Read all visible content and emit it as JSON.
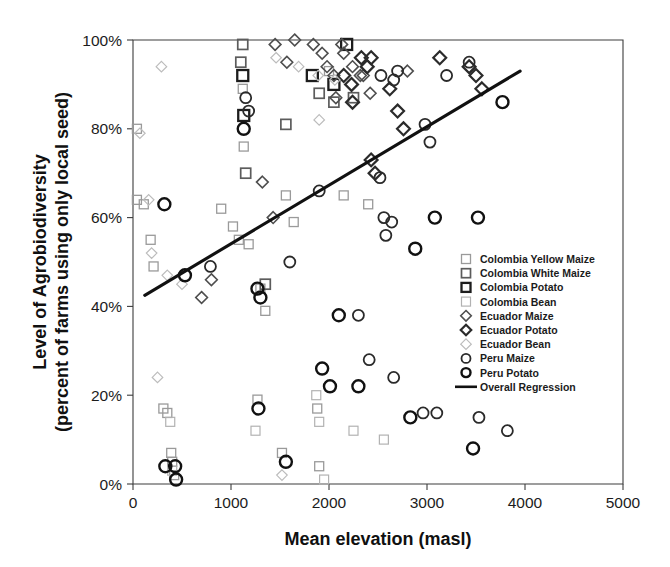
{
  "chart_data": {
    "type": "scatter",
    "title": "",
    "xlabel": "Mean elevation (masl)",
    "ylabel": "Level of Agrobiodiversity (percent of farms using only local seed)",
    "ylabel_line1": "Level of Agrobiodiversity",
    "ylabel_line2": "(percent of farms using only local seed)",
    "xlim": [
      0,
      5000
    ],
    "ylim": [
      0,
      100
    ],
    "xticks": [
      0,
      1000,
      2000,
      3000,
      4000,
      5000
    ],
    "xtick_labels": [
      "0",
      "1000",
      "2000",
      "3000",
      "4000",
      "5000"
    ],
    "yticks": [
      0,
      20,
      40,
      60,
      80,
      100
    ],
    "ytick_labels": [
      "0%",
      "20%",
      "40%",
      "60%",
      "80%",
      "100%"
    ],
    "grid": false,
    "legend_position": "inside-right",
    "series": [
      {
        "name": "Colombia Yellow Maize",
        "marker": "square",
        "color": "#9a9a9a",
        "stroke_width": 1.3,
        "size": 9,
        "points": [
          [
            40,
            80
          ],
          [
            40,
            64
          ],
          [
            110,
            63
          ],
          [
            180,
            55
          ],
          [
            210,
            49
          ],
          [
            310,
            17
          ],
          [
            350,
            16
          ],
          [
            390,
            7
          ],
          [
            400,
            5
          ],
          [
            420,
            2
          ],
          [
            900,
            62
          ],
          [
            1020,
            58
          ],
          [
            1080,
            55
          ],
          [
            1120,
            89
          ],
          [
            1130,
            76
          ],
          [
            1180,
            54
          ],
          [
            1270,
            19
          ],
          [
            1300,
            44
          ],
          [
            1350,
            39
          ],
          [
            1520,
            7
          ],
          [
            1560,
            65
          ],
          [
            1640,
            59
          ],
          [
            1880,
            17
          ],
          [
            1900,
            4
          ],
          [
            2000,
            93
          ],
          [
            2150,
            65
          ],
          [
            2400,
            63
          ]
        ]
      },
      {
        "name": "Colombia White Maize",
        "marker": "square",
        "color": "#5c5c5c",
        "stroke_width": 1.7,
        "size": 10,
        "points": [
          [
            1100,
            95
          ],
          [
            1120,
            99
          ],
          [
            1150,
            70
          ],
          [
            1560,
            81
          ],
          [
            1900,
            88
          ],
          [
            2050,
            86
          ],
          [
            2250,
            87
          ],
          [
            1350,
            45
          ]
        ]
      },
      {
        "name": "Colombia Potato",
        "marker": "square",
        "color": "#1d1d1d",
        "stroke_width": 2.3,
        "size": 11,
        "points": [
          [
            1120,
            92
          ],
          [
            1130,
            83
          ],
          [
            1830,
            92
          ],
          [
            2050,
            90
          ],
          [
            2180,
            99
          ]
        ]
      },
      {
        "name": "Colombia Bean",
        "marker": "square",
        "color": "#b2b2b2",
        "stroke_width": 1.2,
        "size": 9,
        "points": [
          [
            380,
            14
          ],
          [
            400,
            3
          ],
          [
            1250,
            12
          ],
          [
            1870,
            20
          ],
          [
            1900,
            14
          ],
          [
            2250,
            12
          ],
          [
            2560,
            10
          ],
          [
            1950,
            1
          ]
        ]
      },
      {
        "name": "Ecuador Maize",
        "marker": "diamond",
        "color": "#4e4e4e",
        "stroke_width": 1.6,
        "size": 10,
        "points": [
          [
            1650,
            100
          ],
          [
            1840,
            99
          ],
          [
            1930,
            97
          ],
          [
            1980,
            94
          ],
          [
            2130,
            99
          ],
          [
            2150,
            97
          ],
          [
            2240,
            94
          ],
          [
            2320,
            92
          ],
          [
            2350,
            92
          ],
          [
            2420,
            88
          ],
          [
            2800,
            93
          ],
          [
            1450,
            99
          ],
          [
            1570,
            95
          ],
          [
            2050,
            92
          ],
          [
            2070,
            87
          ],
          [
            1320,
            68
          ],
          [
            1430,
            60
          ],
          [
            800,
            46
          ],
          [
            700,
            42
          ]
        ]
      },
      {
        "name": "Ecuador Potato",
        "marker": "diamond",
        "color": "#2b2b2b",
        "stroke_width": 2.2,
        "size": 11,
        "points": [
          [
            2330,
            96
          ],
          [
            2390,
            94
          ],
          [
            2430,
            96
          ],
          [
            3130,
            96
          ],
          [
            2150,
            92
          ],
          [
            2230,
            90
          ],
          [
            2240,
            86
          ],
          [
            2620,
            89
          ],
          [
            2700,
            84
          ],
          [
            2760,
            80
          ],
          [
            2430,
            73
          ],
          [
            2470,
            70
          ],
          [
            3430,
            94
          ],
          [
            3500,
            92
          ],
          [
            3560,
            89
          ]
        ]
      },
      {
        "name": "Ecuador Bean",
        "marker": "diamond",
        "color": "#bcbcbc",
        "stroke_width": 1.2,
        "size": 9,
        "points": [
          [
            290,
            94
          ],
          [
            70,
            79
          ],
          [
            160,
            64
          ],
          [
            190,
            52
          ],
          [
            350,
            47
          ],
          [
            500,
            45
          ],
          [
            1460,
            96
          ],
          [
            1690,
            94
          ],
          [
            1890,
            92
          ],
          [
            1900,
            82
          ],
          [
            2060,
            91
          ],
          [
            250,
            24
          ],
          [
            1520,
            2
          ]
        ]
      },
      {
        "name": "Peru Maize",
        "marker": "circle",
        "color": "#2a2a2a",
        "stroke_width": 1.8,
        "size": 11,
        "points": [
          [
            1150,
            87
          ],
          [
            1180,
            84
          ],
          [
            2530,
            92
          ],
          [
            2660,
            91
          ],
          [
            2700,
            93
          ],
          [
            3200,
            92
          ],
          [
            3430,
            95
          ],
          [
            2980,
            81
          ],
          [
            3030,
            77
          ],
          [
            2520,
            69
          ],
          [
            1900,
            66
          ],
          [
            1600,
            50
          ],
          [
            790,
            49
          ],
          [
            2560,
            60
          ],
          [
            2640,
            59
          ],
          [
            2580,
            56
          ],
          [
            2300,
            38
          ],
          [
            2410,
            28
          ],
          [
            2660,
            24
          ],
          [
            2960,
            16
          ],
          [
            3100,
            16
          ],
          [
            3530,
            15
          ],
          [
            3820,
            12
          ]
        ]
      },
      {
        "name": "Peru Potato",
        "marker": "circle",
        "color": "#111111",
        "stroke_width": 2.4,
        "size": 12,
        "points": [
          [
            1130,
            80
          ],
          [
            320,
            63
          ],
          [
            530,
            47
          ],
          [
            1270,
            44
          ],
          [
            1300,
            42
          ],
          [
            2100,
            38
          ],
          [
            1930,
            26
          ],
          [
            2010,
            22
          ],
          [
            2300,
            22
          ],
          [
            1280,
            17
          ],
          [
            1560,
            5
          ],
          [
            330,
            4
          ],
          [
            430,
            4
          ],
          [
            440,
            1
          ],
          [
            3770,
            86
          ],
          [
            3080,
            60
          ],
          [
            3520,
            60
          ],
          [
            2880,
            53
          ],
          [
            2830,
            15
          ],
          [
            3470,
            8
          ]
        ]
      }
    ],
    "regression": {
      "name": "Overall Regression",
      "x_start": 120,
      "y_start": 42.5,
      "x_end": 3950,
      "y_end": 93.0
    },
    "legend": [
      {
        "label": "Colombia Yellow Maize",
        "marker": "square",
        "color": "#9a9a9a",
        "stroke_width": 1.3,
        "size": 9
      },
      {
        "label": "Colombia White Maize",
        "marker": "square",
        "color": "#5c5c5c",
        "stroke_width": 1.7,
        "size": 9
      },
      {
        "label": "Colombia Potato",
        "marker": "square",
        "color": "#1d1d1d",
        "stroke_width": 2.3,
        "size": 9
      },
      {
        "label": "Colombia Bean",
        "marker": "square",
        "color": "#b2b2b2",
        "stroke_width": 1.2,
        "size": 9
      },
      {
        "label": "Ecuador Maize",
        "marker": "diamond",
        "color": "#4e4e4e",
        "stroke_width": 1.6,
        "size": 9
      },
      {
        "label": "Ecuador Potato",
        "marker": "diamond",
        "color": "#2b2b2b",
        "stroke_width": 2.2,
        "size": 9
      },
      {
        "label": "Ecuador Bean",
        "marker": "diamond",
        "color": "#bcbcbc",
        "stroke_width": 1.2,
        "size": 9
      },
      {
        "label": "Peru Maize",
        "marker": "circle",
        "color": "#2a2a2a",
        "stroke_width": 1.8,
        "size": 9
      },
      {
        "label": "Peru Potato",
        "marker": "circle",
        "color": "#111111",
        "stroke_width": 2.4,
        "size": 9
      },
      {
        "label": "Overall Regression",
        "marker": "line",
        "color": "#111111",
        "stroke_width": 2.6,
        "size": 9
      }
    ]
  }
}
